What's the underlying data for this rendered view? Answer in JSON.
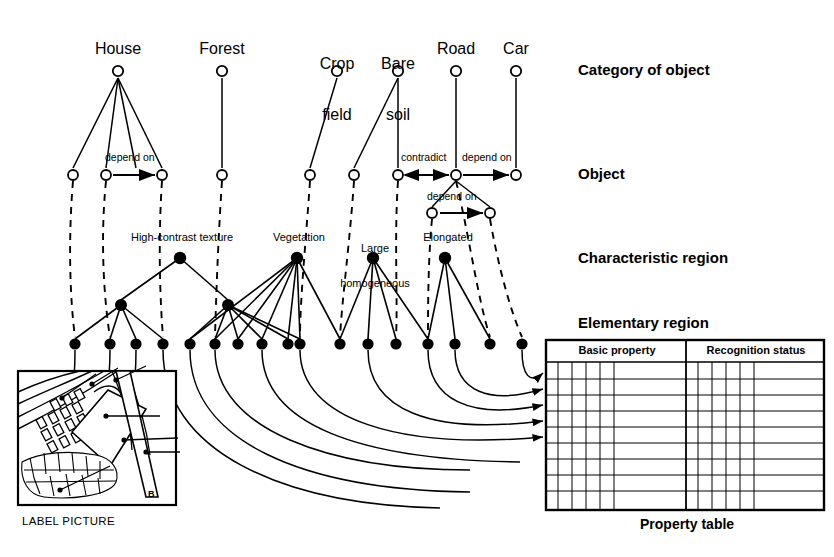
{
  "figure": {
    "kind": "hierarchical-knowledge-network-diagram",
    "ink_color": "#000000",
    "background": "#ffffff"
  },
  "layer_labels": [
    {
      "id": "category-of-object",
      "text": "Category of object",
      "x": 578,
      "y": 62
    },
    {
      "id": "object",
      "text": "Object",
      "x": 578,
      "y": 166
    },
    {
      "id": "characteristic-region",
      "text": "Characteristic region",
      "x": 578,
      "y": 250
    },
    {
      "id": "elementary-region",
      "text": "Elementary region",
      "x": 578,
      "y": 315
    }
  ],
  "categories": [
    {
      "id": "house",
      "label": "House",
      "lines": [
        "House"
      ],
      "x": 118,
      "label_x": 118,
      "label_y": 40
    },
    {
      "id": "forest",
      "label": "Forest",
      "lines": [
        "Forest"
      ],
      "x": 222,
      "label_x": 222,
      "label_y": 40
    },
    {
      "id": "crop-field",
      "label": "Crop field",
      "lines": [
        "Crop",
        "field"
      ],
      "x": 337,
      "label_x": 337,
      "label_y": 22
    },
    {
      "id": "bare-soil",
      "label": "Bare soil",
      "lines": [
        "Bare",
        "soil"
      ],
      "x": 398,
      "label_x": 398,
      "label_y": 22
    },
    {
      "id": "road",
      "label": "Road",
      "lines": [
        "Road"
      ],
      "x": 456,
      "label_x": 456,
      "label_y": 40
    },
    {
      "id": "car",
      "label": "Car",
      "lines": [
        "Car"
      ],
      "x": 516,
      "label_x": 516,
      "label_y": 40
    }
  ],
  "category_node_y": 71,
  "object_node_y": 175,
  "object_nodes_x": [
    73,
    106,
    162,
    222,
    310,
    354,
    398,
    456,
    516
  ],
  "sub_object_nodes": {
    "y": 213,
    "x": [
      432,
      490
    ]
  },
  "relation_labels": [
    {
      "id": "depend-on-house",
      "text": "depend on",
      "x": 134,
      "y": 157
    },
    {
      "id": "contradict-road",
      "text": "contradict",
      "x": 427,
      "y": 157
    },
    {
      "id": "depend-on-road",
      "text": "depend on",
      "x": 487,
      "y": 157
    },
    {
      "id": "depend-on-elongated",
      "text": "depend on",
      "x": 461,
      "y": 196
    }
  ],
  "characteristic_regions": [
    {
      "id": "high-contrast-texture",
      "label": "High-contrast texture",
      "node_x": 180,
      "node_y": 258,
      "label_x": 180,
      "label_y": 232
    },
    {
      "id": "vegetation",
      "label": "Vegetation",
      "node_x": 297,
      "node_y": 258,
      "label_x": 297,
      "label_y": 232
    },
    {
      "id": "large-homogeneous",
      "label": "Large homogeneous",
      "lines": [
        "Large",
        "homogeneous"
      ],
      "node_x": 373,
      "node_y": 258,
      "label_x": 375,
      "label_y": 219
    },
    {
      "id": "elongated",
      "label": "Elongated",
      "node_x": 445,
      "node_y": 258,
      "label_x": 447,
      "label_y": 232
    }
  ],
  "intermediate_nodes": {
    "y": 305,
    "x": [
      121,
      228
    ]
  },
  "elementary_node_y": 344,
  "elementary_nodes_x": [
    75,
    110,
    136,
    163,
    190,
    215,
    238,
    262,
    288,
    300,
    340,
    368,
    396,
    428,
    455,
    490,
    522
  ],
  "label_picture": {
    "caption": "LABEL PICTURE",
    "caption_x": 22,
    "caption_y": 522,
    "box": {
      "x": 18,
      "y": 371,
      "w": 158,
      "h": 134
    },
    "region_letter": "B"
  },
  "property_table": {
    "caption": "Property table",
    "caption_x": 672,
    "caption_y": 524,
    "box": {
      "x": 546,
      "y": 340,
      "w": 278,
      "h": 170
    },
    "header_row_h": 22,
    "column_groups": [
      {
        "id": "basic-property",
        "label": "Basic property"
      },
      {
        "id": "recognition-status",
        "label": "Recognition status"
      }
    ],
    "row_count": 9,
    "arrow_count": 5
  }
}
